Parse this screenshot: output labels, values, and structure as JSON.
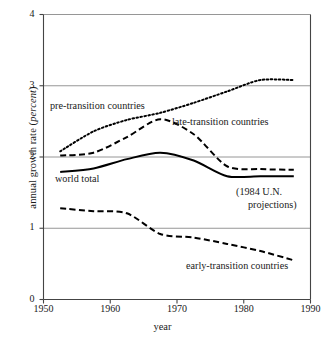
{
  "chart_data": {
    "type": "line",
    "title": "",
    "xlabel": "year",
    "ylabel": "annual growth rate (percent)",
    "ylabel_plain": "annual growth rate (",
    "ylabel_italic": "percent",
    "ylabel_close": ")",
    "xlim": [
      1950,
      1990
    ],
    "ylim": [
      0,
      4
    ],
    "xticks": [
      1950,
      1960,
      1970,
      1980,
      1990
    ],
    "xtick_labels": [
      "1950",
      "1960",
      "1970",
      "1980",
      "1990"
    ],
    "yticks": [
      0,
      1,
      2,
      3,
      4
    ],
    "ytick_labels": [
      "0",
      "1",
      "2",
      "3",
      "4"
    ],
    "grid": "horizontal",
    "legend_position": "inline-annotations",
    "series": [
      {
        "name": "pre-transition countries",
        "style": "dotted",
        "color": "#000000",
        "x": [
          1952.5,
          1957.5,
          1962.5,
          1967.5,
          1972.5,
          1977.5,
          1982.5,
          1987.5
        ],
        "values": [
          2.08,
          2.36,
          2.52,
          2.62,
          2.76,
          2.92,
          3.08,
          3.08
        ]
      },
      {
        "name": "late-transition countries",
        "style": "dashed",
        "color": "#000000",
        "x": [
          1952.5,
          1957.5,
          1962.5,
          1967.5,
          1972.5,
          1977.5,
          1982.5,
          1987.5
        ],
        "values": [
          2.02,
          2.06,
          2.28,
          2.53,
          2.32,
          1.87,
          1.83,
          1.82
        ]
      },
      {
        "name": "world total",
        "style": "solid",
        "color": "#000000",
        "x": [
          1952.5,
          1957.5,
          1962.5,
          1967.5,
          1972.5,
          1977.5,
          1982.5,
          1987.5
        ],
        "values": [
          1.79,
          1.84,
          1.97,
          2.06,
          1.95,
          1.73,
          1.73,
          1.73
        ]
      },
      {
        "name": "early-transition countries",
        "style": "dashed",
        "color": "#000000",
        "x": [
          1952.5,
          1957.5,
          1962.5,
          1967.5,
          1972.5,
          1977.5,
          1982.5,
          1987.5
        ],
        "values": [
          1.28,
          1.24,
          1.21,
          0.92,
          0.87,
          0.78,
          0.68,
          0.55
        ]
      }
    ],
    "annotations": [
      {
        "name": "pre-transition-label",
        "text": "pre-transition countries",
        "x_px": 50,
        "y_px": 100
      },
      {
        "name": "late-transition-label",
        "text": "late-transition countries",
        "x_px": 172,
        "y_px": 116
      },
      {
        "name": "world-total-label",
        "text": "world total",
        "x_px": 55,
        "y_px": 173
      },
      {
        "name": "early-transition-label",
        "text": "early-transition countries",
        "x_px": 186,
        "y_px": 260
      },
      {
        "name": "projection-note",
        "line1": "(1984 U.N.",
        "line2": "projections)",
        "x_px": 236,
        "y_px": 186
      }
    ],
    "axis_color": "#555555",
    "grid_color": "#8a8a8a",
    "line_color": "#000000",
    "background": "#ffffff"
  }
}
